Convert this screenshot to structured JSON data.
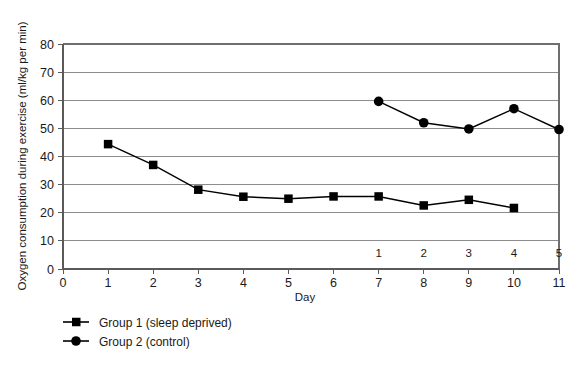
{
  "chart_data": {
    "type": "line",
    "title": "",
    "xlabel": "Day",
    "ylabel": "Oxygen consumption during exercise (ml/kg per min)",
    "xlim": [
      0,
      11
    ],
    "ylim": [
      0,
      80
    ],
    "grid": true,
    "legend_position": "bottom-left",
    "x_ticks": [
      "0",
      "1",
      "2",
      "3",
      "4",
      "5",
      "6",
      "7",
      "8",
      "9",
      "10",
      "11"
    ],
    "y_ticks": [
      "0",
      "10",
      "20",
      "30",
      "40",
      "50",
      "60",
      "70",
      "80"
    ],
    "secondary_x_ticks": [
      {
        "label": "1",
        "at_day": 7
      },
      {
        "label": "2",
        "at_day": 8
      },
      {
        "label": "3",
        "at_day": 9
      },
      {
        "label": "4",
        "at_day": 10
      },
      {
        "label": "5",
        "at_day": 11
      }
    ],
    "series": [
      {
        "name": "Group 1 (sleep deprived)",
        "marker": "square",
        "color": "#000000",
        "x": [
          1,
          2,
          3,
          4,
          5,
          6,
          7,
          8,
          9,
          10
        ],
        "values": [
          44.4,
          37.0,
          28.2,
          25.7,
          25.0,
          25.8,
          25.8,
          22.6,
          24.6,
          21.7
        ]
      },
      {
        "name": "Group 2 (control)",
        "marker": "circle",
        "color": "#000000",
        "x": [
          7,
          8,
          9,
          10,
          11
        ],
        "values": [
          59.6,
          52.0,
          49.8,
          57.0,
          49.6
        ]
      }
    ],
    "legend": [
      {
        "label": "Group 1 (sleep deprived)",
        "marker": "square"
      },
      {
        "label": "Group 2 (control)",
        "marker": "circle"
      }
    ]
  },
  "colors": {
    "background": "#ffffff",
    "ink": "#000000",
    "gridline": "#8c8c8c",
    "axis": "#5a5a5a",
    "plot_border": "#6e6e6e"
  }
}
